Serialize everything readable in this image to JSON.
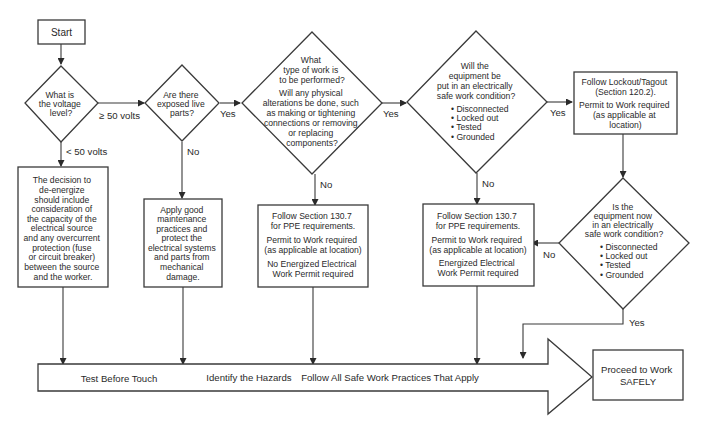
{
  "nodes": {
    "start": {
      "label": "Start"
    },
    "voltage_decision": {
      "lines": [
        "What is",
        "the voltage",
        "level?"
      ]
    },
    "exposed_decision": {
      "lines": [
        "Are there",
        "exposed live",
        "parts?"
      ]
    },
    "work_type_decision": {
      "lines": [
        "What",
        "type of work is",
        "to be performed?"
      ],
      "lines2": [
        "Will any physical",
        "alterations be done, such",
        "as making or tightening",
        "connections or removing",
        "or replacing",
        "components?"
      ]
    },
    "esw_decision": {
      "lines": [
        "Will the",
        "equipment be",
        "put in an electrically",
        "safe work condition?"
      ],
      "bullets": [
        "• Disconnected",
        "• Locked out",
        "• Tested",
        "• Grounded"
      ]
    },
    "lockout_box": {
      "lines": [
        "Follow Lockout/Tagout",
        "(Section 120.2)."
      ],
      "lines2": [
        "Permit to Work required",
        "(as applicable at",
        "location)"
      ]
    },
    "esw_now_decision": {
      "lines": [
        "Is the",
        "equipment now",
        "in an electrically",
        "safe work condition?"
      ],
      "bullets": [
        "• Disconnected",
        "• Locked out",
        "• Tested",
        "• Grounded"
      ]
    },
    "deenergize_box": {
      "lines": [
        "The decision to",
        "de-energize",
        "should include",
        "consideration of",
        "the capacity of the",
        "electrical source",
        "and any overcurrent",
        "protection (fuse",
        "or circuit breaker)",
        "between the source",
        "and the worker."
      ]
    },
    "maintenance_box": {
      "lines": [
        "Apply good",
        "maintenance",
        "practices and",
        "protect the",
        "electrical systems",
        "and parts from",
        "mechanical",
        "damage."
      ]
    },
    "ppe_no_permit_box": {
      "lines": [
        "Follow Section 130.7",
        "for PPE requirements."
      ],
      "lines2": [
        "Permit to Work required",
        "(as applicable at location)"
      ],
      "lines3": [
        "No Energized Electrical",
        "Work Permit required"
      ]
    },
    "ppe_permit_box": {
      "lines": [
        "Follow Section 130.7",
        "for PPE requirements."
      ],
      "lines2": [
        "Permit to Work required",
        "(as applicable at location)"
      ],
      "lines3": [
        "Energized Electrical",
        "Work Permit required"
      ]
    },
    "big_arrow": {
      "items": [
        "Test Before Touch",
        "Identify the Hazards",
        "Follow All Safe Work Practices That Apply"
      ]
    },
    "proceed_box": {
      "lines": [
        "Proceed to Work",
        "SAFELY"
      ]
    }
  },
  "edge_labels": {
    "ge50": "≥ 50 volts",
    "lt50": "< 50 volts",
    "exposed_yes": "Yes",
    "exposed_no": "No",
    "work_yes": "Yes",
    "work_no": "No",
    "esw_yes": "Yes",
    "esw_no": "No",
    "esw_now_no": "No",
    "esw_now_yes": "Yes"
  }
}
